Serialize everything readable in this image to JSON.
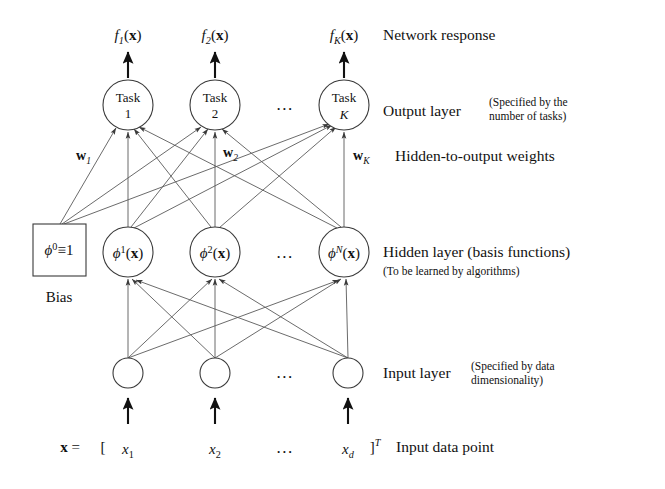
{
  "figure": {
    "background": "#ffffff",
    "stroke_color": "#3a3a3a",
    "edge_color": "#5a5a5a",
    "text_color": "#111111"
  },
  "network_response": {
    "row_label": "Network response",
    "outputs": [
      {
        "base": "f",
        "sub": "1",
        "arg": "(x)"
      },
      {
        "base": "f",
        "sub": "2",
        "arg": "(x)"
      },
      {
        "base": "f",
        "sub": "K",
        "arg": "(x)"
      }
    ],
    "ellipsis": "..."
  },
  "output_layer": {
    "row_label": "Output layer",
    "row_note_line1": "(Specified by the",
    "row_note_line2": "number of tasks)",
    "nodes": [
      {
        "line1": "Task",
        "line2": "1",
        "italic_line2": false
      },
      {
        "line1": "Task",
        "line2": "2",
        "italic_line2": false
      },
      {
        "line1": "Task",
        "line2": "K",
        "italic_line2": true
      }
    ],
    "ellipsis": "..."
  },
  "weights": {
    "row_label": "Hidden-to-output weights",
    "labels": [
      {
        "base": "w",
        "sub": "1"
      },
      {
        "base": "w",
        "sub": "2"
      },
      {
        "base": "w",
        "sub": "K"
      }
    ]
  },
  "hidden_layer": {
    "row_label": "Hidden layer (basis functions)",
    "row_note": "(To be learned by algorithms)",
    "bias": {
      "symbol": "ϕ",
      "sup": "0",
      "rel": "≡1",
      "caption": "Bias"
    },
    "nodes": [
      {
        "symbol": "ϕ",
        "sup": "1",
        "arg": "(x)"
      },
      {
        "symbol": "ϕ",
        "sup": "2",
        "arg": "(x)"
      },
      {
        "symbol": "ϕ",
        "sup": "N",
        "arg": "(x)"
      }
    ],
    "ellipsis": "..."
  },
  "input_layer": {
    "row_label": "Input layer",
    "row_note_line1": "(Specified by data",
    "row_note_line2": "dimensionality)",
    "node_count": 3,
    "ellipsis": "..."
  },
  "input_vector": {
    "caption": "Input data point",
    "vector_symbol": "x",
    "equals": "=",
    "open_bracket": "[",
    "close_bracket": "]",
    "transpose": "T",
    "components": [
      {
        "base": "x",
        "sub": "1"
      },
      {
        "base": "x",
        "sub": "2"
      },
      {
        "base": "x",
        "sub": "d"
      }
    ],
    "ellipsis": "..."
  },
  "geometry": {
    "column_x": [
      128,
      215,
      344
    ],
    "dots_x": 285,
    "output_y": 105,
    "hidden_y": 252,
    "input_y": 373,
    "node_radius": 25,
    "input_radius": 15,
    "bias_box": {
      "x": 33,
      "y": 224,
      "w": 53,
      "h": 52
    }
  }
}
